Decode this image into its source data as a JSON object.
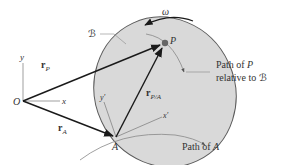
{
  "diagram": {
    "body_label": "ℬ",
    "omega_label": "ω",
    "origin_label": "O",
    "x_axis_label": "x",
    "y_axis_label": "y",
    "point_p_label": "P",
    "point_a_label": "A",
    "x_prime_label": "x′",
    "y_prime_label": "y′",
    "vector_rp": {
      "main": "r",
      "sub": "P"
    },
    "vector_ra": {
      "main": "r",
      "sub": "A"
    },
    "vector_rpa": {
      "main": "r",
      "sub": "P/A"
    },
    "path_p_label_line1": "Path of",
    "path_p_label_line1_var": "P",
    "path_p_label_line2": "relative to",
    "path_p_label_line2_var": "ℬ",
    "path_a_label": "Path of",
    "path_a_label_var": "A",
    "colors": {
      "body_fill": "#d9d9d9",
      "body_stroke": "#5a5a5a",
      "vector": "#1a1a1a",
      "axis": "#777777",
      "point": "#666666",
      "text": "#333333"
    }
  }
}
